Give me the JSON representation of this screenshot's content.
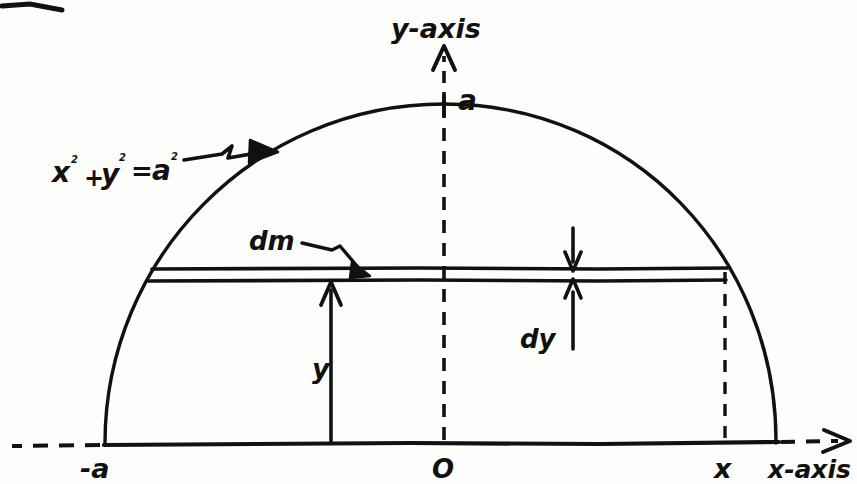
{
  "figure": {
    "type": "hand-drawn-geometry-diagram",
    "ink_color": "#111111",
    "paper_color": "#fdfdfb"
  },
  "axes": {
    "x_axis_label": "x-axis",
    "y_axis_label": "y-axis",
    "origin_label": "O"
  },
  "labels": {
    "circle_equation_x": "x",
    "circle_equation_exp1": "2",
    "circle_equation_plus": "+",
    "circle_equation_y": "y",
    "circle_equation_exp2": "2",
    "circle_equation_equals": "=",
    "circle_equation_a": "a",
    "circle_equation_exp3": "2",
    "circle_equation_full": "x² + y² = a²",
    "radius_top": "a",
    "left_intercept": "-a",
    "right_intercept": "x",
    "mass_element": "dm",
    "strip_thickness": "dy",
    "height_from_axis": "y"
  },
  "geometry": {
    "circle_center_x": 442,
    "circle_center_y": 443,
    "circle_radius": 338,
    "strip_top_y": 268,
    "strip_bottom_y": 280,
    "dashed_vertical_x": 725,
    "y_arrow_x": 330
  }
}
